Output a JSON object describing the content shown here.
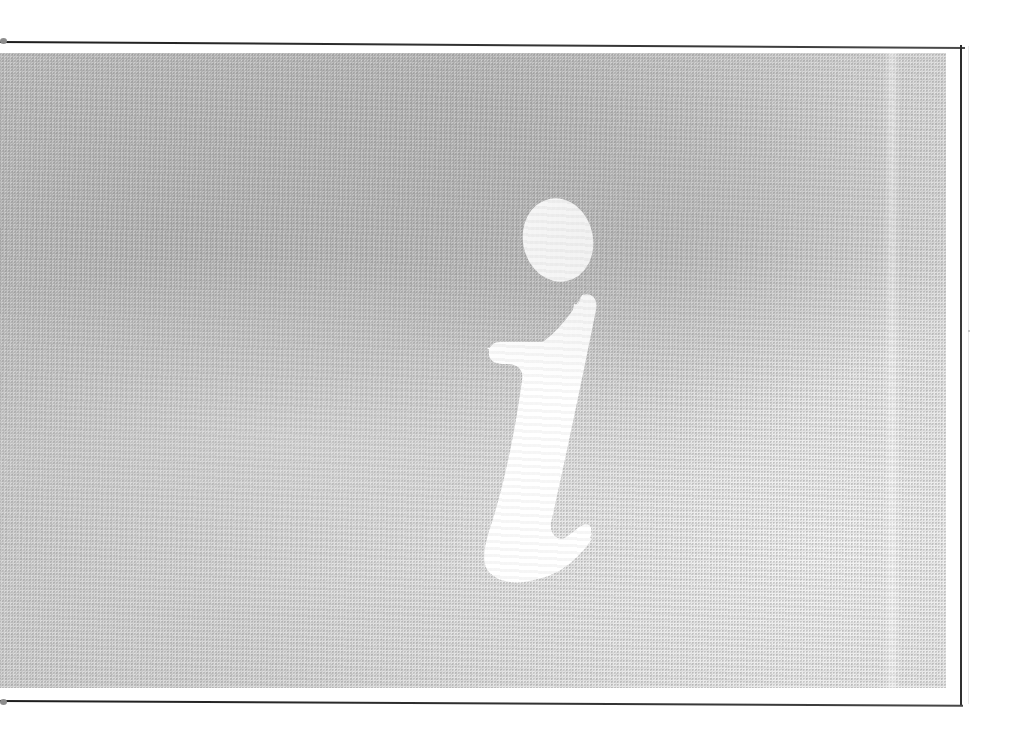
{
  "document": {
    "kind": "scanned-page",
    "page_title": "Information symbol page",
    "caption": "",
    "symbol": {
      "name": "information-symbol",
      "glyph": "i",
      "style": "italic serif, white knockout",
      "color": "#ffffff"
    },
    "panel": {
      "name": "halftone-gray-panel",
      "fill_color": "#d3d3d3",
      "texture": "halftone dot grain",
      "left": 0,
      "top": 52,
      "width": 948,
      "height": 637
    },
    "rules": {
      "top_rule_color": "#2b2b2b",
      "bottom_rule_color": "#2b2b2b",
      "right_rule_color": "#2b2b2b"
    },
    "background_color": "#ffffff",
    "alt_text": "Large white italic letter i on a gray halftone rectangle, framed by thin black rules on the top, right and bottom."
  }
}
